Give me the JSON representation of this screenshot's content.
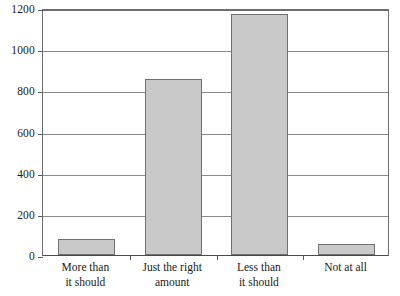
{
  "chart_data": {
    "type": "bar",
    "title": "",
    "subtitle": "",
    "xlabel": "",
    "ylabel": "",
    "categories": [
      "More than it should",
      "Just the right amount",
      "Less than it should",
      "Not at all"
    ],
    "category_lines": [
      [
        "More than",
        "it should"
      ],
      [
        "Just the right",
        "amount"
      ],
      [
        "Less than",
        "it should"
      ],
      [
        "Not at all"
      ]
    ],
    "values": [
      80,
      855,
      1170,
      55
    ],
    "ylim": [
      0,
      1200
    ],
    "yticks": [
      0,
      200,
      400,
      600,
      800,
      1000,
      1200
    ],
    "ytick_labels": [
      "0",
      "200",
      "400",
      "600",
      "800",
      "1000",
      "1200"
    ],
    "grid": true,
    "grid_axis": "y",
    "legend": false,
    "legend_position": "none",
    "bar_fill": "#c9c9c9",
    "bar_border": "#707070",
    "axis_color": "#5a5a5a",
    "grid_color": "#8a8a8a",
    "background": "#ffffff"
  }
}
